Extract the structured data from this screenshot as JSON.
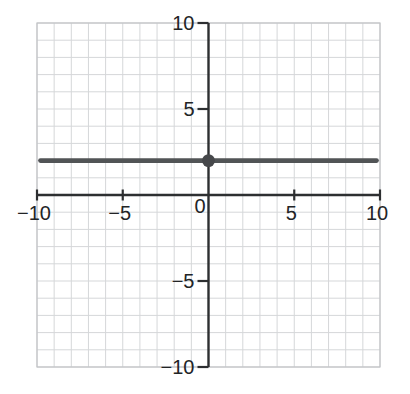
{
  "figure": {
    "background": "#ffffff"
  },
  "chart_data": {
    "type": "line",
    "title": "",
    "xlabel": "",
    "ylabel": "",
    "xlim": [
      -10,
      10
    ],
    "ylim": [
      -10,
      10
    ],
    "grid": {
      "on": true,
      "step": 1,
      "color": "#d5d7d9",
      "frame_color": "#c2c4c6"
    },
    "axes": {
      "color": "#2d2f31",
      "tick_label_color": "#222426",
      "x_ticks": [
        -10,
        -5,
        5,
        10
      ],
      "x_tick_labels": [
        "−10",
        "−5",
        "5",
        "10"
      ],
      "y_ticks": [
        -10,
        -5,
        5,
        10
      ],
      "y_tick_labels": [
        "−10",
        "−5",
        "5",
        "10"
      ],
      "origin_label": "0"
    },
    "series": [
      {
        "name": "horizontal line",
        "equation": "y = 2",
        "color": "#515456",
        "stroke_width": 4.6,
        "points": [
          [
            -9.8,
            2
          ],
          [
            9.8,
            2
          ]
        ]
      }
    ],
    "marked_points": [
      {
        "x": 0,
        "y": 2,
        "color": "#46484b",
        "radius": 6.4
      }
    ]
  }
}
